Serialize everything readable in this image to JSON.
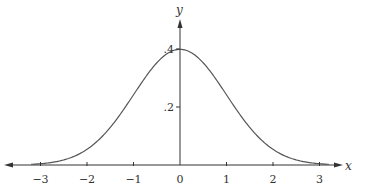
{
  "chart_data": {
    "type": "line",
    "title": "",
    "xlabel": "x",
    "ylabel": "y",
    "xlim": [
      -3.3,
      3.3
    ],
    "ylim": [
      0,
      0.45
    ],
    "grid": false,
    "legend": null,
    "x_ticks": [
      -3,
      -2,
      -1,
      0,
      1,
      2,
      3
    ],
    "x_tick_labels": [
      "−3",
      "−2",
      "−1",
      "0",
      "1",
      "2",
      "3"
    ],
    "y_ticks": [
      0.2,
      0.4
    ],
    "y_tick_labels": [
      ".2",
      ".4"
    ],
    "series": [
      {
        "name": "standard normal density",
        "function": "exp(-x^2/2)/sqrt(2*pi)",
        "x": [
          -3.2,
          -3,
          -2.5,
          -2,
          -1.5,
          -1,
          -0.5,
          0,
          0.5,
          1,
          1.5,
          2,
          2.5,
          3,
          3.2
        ],
        "values": [
          0.0024,
          0.0044,
          0.0175,
          0.054,
          0.1295,
          0.242,
          0.3521,
          0.3989,
          0.3521,
          0.242,
          0.1295,
          0.054,
          0.0175,
          0.0044,
          0.0024
        ]
      }
    ],
    "colors": {
      "axis": "#333333",
      "curve": "#555555"
    }
  }
}
